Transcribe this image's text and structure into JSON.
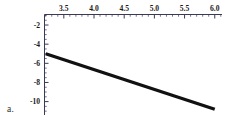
{
  "figure": {
    "caption": "a.",
    "background_color": "#ffffff",
    "axis_color": "#3a3a55",
    "line_color": "#111111"
  },
  "chart_data": {
    "type": "line",
    "title": "",
    "xlabel": "",
    "ylabel": "",
    "xlim": [
      3.18,
      6.12
    ],
    "ylim": [
      -11.4,
      -0.9
    ],
    "grid": false,
    "legend": null,
    "x_axis_position": "top",
    "y_axis_position": "left",
    "xticks": [
      3.5,
      4.0,
      4.5,
      5.0,
      5.5,
      6.0
    ],
    "xtick_labels": [
      "3.5",
      "4.0",
      "4.5",
      "5.0",
      "5.5",
      "6.0"
    ],
    "yticks": [
      -2,
      -4,
      -6,
      -8,
      -10
    ],
    "ytick_labels": [
      "-2",
      "-4",
      "-6",
      "-8",
      "-10"
    ],
    "x_minor_tick_step": 0.1,
    "y_minor_tick_step": 0.5,
    "series": [
      {
        "name": "line",
        "x": [
          3.2,
          6.0
        ],
        "y": [
          -5.0,
          -10.8
        ],
        "color": "#111111",
        "width": 3.4
      }
    ]
  }
}
